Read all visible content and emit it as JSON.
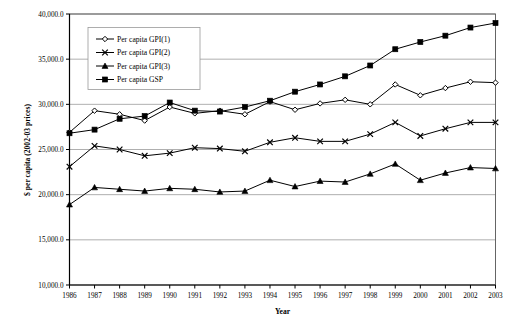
{
  "chart_data": {
    "type": "line",
    "title": "",
    "xlabel": "Year",
    "ylabel": "$ per capita (2002-03 prices)",
    "x": [
      1986,
      1987,
      1988,
      1989,
      1990,
      1991,
      1992,
      1993,
      1994,
      1995,
      1996,
      1997,
      1998,
      1999,
      2000,
      2001,
      2002,
      2003
    ],
    "categories": [
      "1986",
      "1987",
      "1988",
      "1989",
      "1990",
      "1991",
      "1992",
      "1993",
      "1994",
      "1995",
      "1996",
      "1997",
      "1998",
      "1999",
      "2000",
      "2001",
      "2002",
      "2003"
    ],
    "xlim": [
      1986,
      2003
    ],
    "ylim": [
      10000,
      40000
    ],
    "ytick_values": [
      10000,
      15000,
      20000,
      25000,
      30000,
      35000,
      40000
    ],
    "ytick_labels": [
      "10,000.0",
      "15,000.0",
      "20,000.0",
      "25,000.0",
      "30,000.0",
      "35,000.0",
      "40,000.0"
    ],
    "grid": "horizontal",
    "legend_position": "top-left-inside",
    "series": [
      {
        "name": "Per capita GPI(1)",
        "marker": "open-diamond",
        "color": "#000000",
        "values": [
          26900,
          29300,
          28900,
          28200,
          29700,
          29000,
          29300,
          28900,
          30300,
          29400,
          30100,
          30500,
          30000,
          32200,
          31000,
          31800,
          32500,
          32400
        ]
      },
      {
        "name": "Per capita GPI(2)",
        "marker": "cross",
        "color": "#000000",
        "values": [
          23100,
          25400,
          25000,
          24300,
          24600,
          25200,
          25100,
          24800,
          25800,
          26300,
          25900,
          25900,
          26700,
          28000,
          26500,
          27300,
          28000,
          28000
        ]
      },
      {
        "name": "Per capita GPI(3)",
        "marker": "filled-triangle",
        "color": "#000000",
        "values": [
          18900,
          20800,
          20600,
          20400,
          20700,
          20600,
          20300,
          20400,
          21600,
          20900,
          21500,
          21400,
          22300,
          23400,
          21600,
          22400,
          23000,
          22900
        ]
      },
      {
        "name": "Per capita GSP",
        "marker": "filled-square",
        "color": "#000000",
        "values": [
          26800,
          27200,
          28400,
          28700,
          30200,
          29300,
          29200,
          29700,
          30400,
          31400,
          32200,
          33100,
          34300,
          36100,
          36900,
          37600,
          38500,
          39000
        ]
      }
    ]
  }
}
